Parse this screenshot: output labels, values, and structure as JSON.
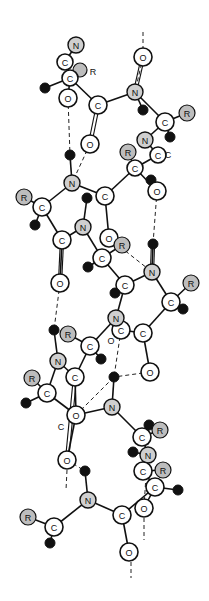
{
  "diagram": {
    "colors": {
      "background": "#ffffff",
      "line": "#111111",
      "nitrogen": "#cfcfcf",
      "r_group": "#bdbdbd",
      "hydrogen": "#111111"
    },
    "atoms": [
      {
        "id": "n1",
        "el": "N",
        "x": 76,
        "y": 45,
        "r": 8
      },
      {
        "id": "c1",
        "el": "C",
        "x": 65,
        "y": 62,
        "r": 8
      },
      {
        "id": "r1",
        "el": "R",
        "x": 80,
        "y": 70,
        "r": 7,
        "label": ""
      },
      {
        "id": "c2",
        "el": "C",
        "x": 70,
        "y": 78,
        "r": 8
      },
      {
        "id": "h1",
        "el": "H",
        "x": 45,
        "y": 88,
        "r": 5
      },
      {
        "id": "o1",
        "el": "O",
        "x": 68,
        "y": 98,
        "r": 9
      },
      {
        "id": "c3",
        "el": "C",
        "x": 98,
        "y": 105,
        "r": 9
      },
      {
        "id": "o2",
        "el": "O",
        "x": 143,
        "y": 57,
        "r": 9
      },
      {
        "id": "n2",
        "el": "N",
        "x": 135,
        "y": 92,
        "r": 8
      },
      {
        "id": "h2",
        "el": "H",
        "x": 143,
        "y": 110,
        "r": 5
      },
      {
        "id": "c4",
        "el": "C",
        "x": 165,
        "y": 122,
        "r": 9
      },
      {
        "id": "r2",
        "el": "R",
        "x": 187,
        "y": 113,
        "r": 8
      },
      {
        "id": "h3",
        "el": "H",
        "x": 170,
        "y": 137,
        "r": 5
      },
      {
        "id": "o3",
        "el": "O",
        "x": 90,
        "y": 144,
        "r": 9
      },
      {
        "id": "n3",
        "el": "N",
        "x": 145,
        "y": 140,
        "r": 8
      },
      {
        "id": "c5",
        "el": "C",
        "x": 158,
        "y": 155,
        "r": 8
      },
      {
        "id": "r3",
        "el": "R",
        "x": 128,
        "y": 152,
        "r": 8
      },
      {
        "id": "c6",
        "el": "C",
        "x": 135,
        "y": 168,
        "r": 8
      },
      {
        "id": "h4",
        "el": "H",
        "x": 151,
        "y": 180,
        "r": 5
      },
      {
        "id": "o4",
        "el": "O",
        "x": 157,
        "y": 191,
        "r": 9
      },
      {
        "id": "h5",
        "el": "H",
        "x": 70,
        "y": 155,
        "r": 5
      },
      {
        "id": "n4",
        "el": "N",
        "x": 72,
        "y": 183,
        "r": 8
      },
      {
        "id": "r4",
        "el": "R",
        "x": 24,
        "y": 197,
        "r": 8
      },
      {
        "id": "c7",
        "el": "C",
        "x": 42,
        "y": 207,
        "r": 9
      },
      {
        "id": "h6",
        "el": "H",
        "x": 35,
        "y": 225,
        "r": 5
      },
      {
        "id": "c8",
        "el": "C",
        "x": 105,
        "y": 196,
        "r": 9
      },
      {
        "id": "h7",
        "el": "H",
        "x": 87,
        "y": 198,
        "r": 5
      },
      {
        "id": "n5",
        "el": "N",
        "x": 83,
        "y": 227,
        "r": 8
      },
      {
        "id": "c9",
        "el": "C",
        "x": 62,
        "y": 240,
        "r": 9
      },
      {
        "id": "o5",
        "el": "O",
        "x": 109,
        "y": 238,
        "r": 9
      },
      {
        "id": "r5",
        "el": "R",
        "x": 122,
        "y": 245,
        "r": 8
      },
      {
        "id": "c10",
        "el": "C",
        "x": 102,
        "y": 258,
        "r": 9
      },
      {
        "id": "h8",
        "el": "H",
        "x": 88,
        "y": 267,
        "r": 5
      },
      {
        "id": "h9",
        "el": "H",
        "x": 153,
        "y": 244,
        "r": 5
      },
      {
        "id": "n6",
        "el": "N",
        "x": 152,
        "y": 272,
        "r": 8
      },
      {
        "id": "r6",
        "el": "R",
        "x": 191,
        "y": 283,
        "r": 8
      },
      {
        "id": "o6",
        "el": "O",
        "x": 60,
        "y": 283,
        "r": 9
      },
      {
        "id": "c11",
        "el": "C",
        "x": 125,
        "y": 285,
        "r": 9
      },
      {
        "id": "h10",
        "el": "H",
        "x": 115,
        "y": 293,
        "r": 5
      },
      {
        "id": "c12",
        "el": "C",
        "x": 171,
        "y": 302,
        "r": 9
      },
      {
        "id": "h11",
        "el": "H",
        "x": 183,
        "y": 309,
        "r": 5
      },
      {
        "id": "c13",
        "el": "C",
        "x": 121,
        "y": 330,
        "r": 9
      },
      {
        "id": "n7",
        "el": "N",
        "x": 116,
        "y": 318,
        "r": 8
      },
      {
        "id": "c14",
        "el": "C",
        "x": 143,
        "y": 333,
        "r": 9
      },
      {
        "id": "h12",
        "el": "H",
        "x": 54,
        "y": 330,
        "r": 5
      },
      {
        "id": "r7",
        "el": "R",
        "x": 68,
        "y": 334,
        "r": 8
      },
      {
        "id": "c15",
        "el": "C",
        "x": 90,
        "y": 346,
        "r": 9
      },
      {
        "id": "h13",
        "el": "H",
        "x": 101,
        "y": 359,
        "r": 5
      },
      {
        "id": "n8",
        "el": "N",
        "x": 58,
        "y": 361,
        "r": 8
      },
      {
        "id": "c16",
        "el": "C",
        "x": 75,
        "y": 377,
        "r": 9
      },
      {
        "id": "o7",
        "el": "O",
        "x": 150,
        "y": 372,
        "r": 9
      },
      {
        "id": "h14",
        "el": "H",
        "x": 114,
        "y": 377,
        "r": 5
      },
      {
        "id": "r8",
        "el": "R",
        "x": 32,
        "y": 378,
        "r": 8
      },
      {
        "id": "c17",
        "el": "C",
        "x": 47,
        "y": 393,
        "r": 9
      },
      {
        "id": "h15",
        "el": "H",
        "x": 26,
        "y": 403,
        "r": 5
      },
      {
        "id": "n9",
        "el": "N",
        "x": 112,
        "y": 407,
        "r": 8
      },
      {
        "id": "o8",
        "el": "O",
        "x": 76,
        "y": 415,
        "r": 9
      },
      {
        "id": "h16",
        "el": "H",
        "x": 149,
        "y": 425,
        "r": 5
      },
      {
        "id": "r9",
        "el": "R",
        "x": 160,
        "y": 430,
        "r": 8
      },
      {
        "id": "c18",
        "el": "C",
        "x": 142,
        "y": 437,
        "r": 9
      },
      {
        "id": "h17",
        "el": "H",
        "x": 133,
        "y": 452,
        "r": 5
      },
      {
        "id": "n10",
        "el": "N",
        "x": 148,
        "y": 455,
        "r": 8
      },
      {
        "id": "o9",
        "el": "O",
        "x": 67,
        "y": 460,
        "r": 9
      },
      {
        "id": "h18",
        "el": "H",
        "x": 85,
        "y": 471,
        "r": 5
      },
      {
        "id": "c19",
        "el": "C",
        "x": 143,
        "y": 471,
        "r": 9
      },
      {
        "id": "r10",
        "el": "R",
        "x": 163,
        "y": 470,
        "r": 8
      },
      {
        "id": "c20",
        "el": "C",
        "x": 155,
        "y": 487,
        "r": 9
      },
      {
        "id": "h19",
        "el": "H",
        "x": 178,
        "y": 490,
        "r": 5
      },
      {
        "id": "n11",
        "el": "N",
        "x": 88,
        "y": 500,
        "r": 8
      },
      {
        "id": "o10",
        "el": "O",
        "x": 144,
        "y": 508,
        "r": 9
      },
      {
        "id": "c21",
        "el": "C",
        "x": 122,
        "y": 515,
        "r": 9
      },
      {
        "id": "r11",
        "el": "R",
        "x": 28,
        "y": 517,
        "r": 8
      },
      {
        "id": "c22",
        "el": "C",
        "x": 54,
        "y": 527,
        "r": 9
      },
      {
        "id": "h20",
        "el": "H",
        "x": 50,
        "y": 543,
        "r": 5
      },
      {
        "id": "o11",
        "el": "O",
        "x": 129,
        "y": 552,
        "r": 9
      }
    ],
    "bonds": [
      [
        "n1",
        "c1"
      ],
      [
        "c1",
        "c2"
      ],
      [
        "c2",
        "r1"
      ],
      [
        "c2",
        "h1"
      ],
      [
        "c2",
        "o1"
      ],
      [
        "c2",
        "c3"
      ],
      [
        "c3",
        "n2"
      ],
      [
        "o2",
        "o2top"
      ],
      [
        "n2",
        "c4"
      ],
      [
        "c4",
        "r2"
      ],
      [
        "c4",
        "h3"
      ],
      [
        "c4",
        "n3"
      ],
      [
        "n2",
        "h2"
      ],
      [
        "n3",
        "c5"
      ],
      [
        "c5",
        "c6"
      ],
      [
        "c6",
        "r3"
      ],
      [
        "c6",
        "o4"
      ],
      [
        "c6",
        "c8"
      ],
      [
        "h5",
        "n4"
      ],
      [
        "n4",
        "c7"
      ],
      [
        "c7",
        "r4"
      ],
      [
        "c7",
        "h6"
      ],
      [
        "c7",
        "c9"
      ],
      [
        "n4",
        "c8"
      ],
      [
        "c8",
        "o5"
      ],
      [
        "h7",
        "n5"
      ],
      [
        "n5",
        "c9"
      ],
      [
        "n5",
        "c10"
      ],
      [
        "c10",
        "r5"
      ],
      [
        "c10",
        "h8"
      ],
      [
        "c10",
        "c11"
      ],
      [
        "c9",
        "o6"
      ],
      [
        "h9",
        "n6"
      ],
      [
        "n6",
        "c11"
      ],
      [
        "n6",
        "c12"
      ],
      [
        "c12",
        "r6"
      ],
      [
        "c12",
        "h11"
      ],
      [
        "c12",
        "c14"
      ],
      [
        "c11",
        "h10"
      ],
      [
        "c11",
        "n7"
      ],
      [
        "n7",
        "c13"
      ],
      [
        "c13",
        "c14"
      ],
      [
        "c14",
        "o7"
      ],
      [
        "n7",
        "c15"
      ],
      [
        "c15",
        "r7"
      ],
      [
        "c15",
        "h13"
      ],
      [
        "c15",
        "c16"
      ],
      [
        "h12",
        "n8"
      ],
      [
        "n8",
        "c16"
      ],
      [
        "n8",
        "c17"
      ],
      [
        "c17",
        "r8"
      ],
      [
        "c17",
        "h15"
      ],
      [
        "c17",
        "o8"
      ],
      [
        "c16",
        "o8"
      ],
      [
        "h14",
        "n9"
      ],
      [
        "o8",
        "n9"
      ],
      [
        "n9",
        "c18"
      ],
      [
        "c18",
        "r9"
      ],
      [
        "c18",
        "h16"
      ],
      [
        "c18",
        "n10"
      ],
      [
        "n10",
        "h17"
      ],
      [
        "n10",
        "c19"
      ],
      [
        "c19",
        "r10"
      ],
      [
        "c19",
        "c20"
      ],
      [
        "c20",
        "h19"
      ],
      [
        "c20",
        "o10"
      ],
      [
        "o9",
        "o8"
      ],
      [
        "h18",
        "n11"
      ],
      [
        "n11",
        "c22"
      ],
      [
        "c22",
        "r11"
      ],
      [
        "c22",
        "h20"
      ],
      [
        "n11",
        "c21"
      ],
      [
        "c21",
        "o11"
      ],
      [
        "c21",
        "c20"
      ]
    ],
    "double_bonds": [
      [
        "c3",
        "o3"
      ],
      [
        "c9",
        "o6"
      ],
      [
        "c16",
        "o9"
      ],
      [
        "n2",
        "o2"
      ],
      [
        "n6",
        "h9"
      ]
    ],
    "hbonds": [
      [
        "o1",
        "h5"
      ],
      [
        "o2",
        "n2"
      ],
      [
        "o3",
        "n4"
      ],
      [
        "o4",
        "h9"
      ],
      [
        "o6",
        "h12"
      ],
      [
        "o5",
        "n6"
      ],
      [
        "o7",
        "h14"
      ],
      [
        "c13",
        "h14"
      ],
      [
        "o9",
        "h18"
      ],
      [
        "o10",
        "h16"
      ],
      [
        "o8",
        "h14"
      ]
    ],
    "free_labels": [
      {
        "text": "R",
        "x": 93,
        "y": 72
      },
      {
        "text": "C",
        "x": 168,
        "y": 155
      },
      {
        "text": "O",
        "x": 111,
        "y": 341
      },
      {
        "text": "C",
        "x": 61,
        "y": 427
      }
    ],
    "tails": [
      {
        "x1": 143,
        "y1": 32,
        "x2": 143,
        "y2": 48
      },
      {
        "x1": 67,
        "y1": 470,
        "x2": 66,
        "y2": 490
      },
      {
        "x1": 144,
        "y1": 518,
        "x2": 144,
        "y2": 540
      },
      {
        "x1": 131,
        "y1": 562,
        "x2": 131,
        "y2": 578
      }
    ]
  }
}
